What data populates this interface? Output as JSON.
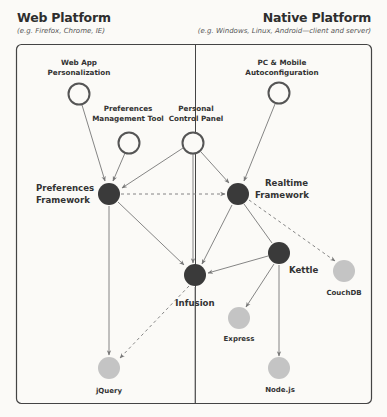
{
  "platforms": {
    "web": {
      "title": "Web Platform",
      "subtitle": "(e.g. Firefox, Chrome, IE)"
    },
    "native": {
      "title": "Native Platform",
      "subtitle": "(e.g. Windows, Linux, Android—client and server)"
    }
  },
  "nodes": {
    "web_app_personalization": {
      "label_line1": "Web App",
      "label_line2": "Personalization",
      "kind": "open"
    },
    "preferences_management_tool": {
      "label_line1": "Preferences",
      "label_line2": "Management Tool",
      "kind": "open"
    },
    "personal_control_panel": {
      "label_line1": "Personal",
      "label_line2": "Control Panel",
      "kind": "open"
    },
    "pc_mobile_autoconfiguration": {
      "label_line1": "PC & Mobile",
      "label_line2": "Autoconfiguration",
      "kind": "open"
    },
    "preferences_framework": {
      "label_line1": "Preferences",
      "label_line2": "Framework",
      "kind": "dark"
    },
    "realtime_framework": {
      "label_line1": "Realtime",
      "label_line2": "Framework",
      "kind": "dark"
    },
    "infusion": {
      "label": "Infusion",
      "kind": "dark"
    },
    "kettle": {
      "label": "Kettle",
      "kind": "dark"
    },
    "couchdb": {
      "label": "CouchDB",
      "kind": "external"
    },
    "express": {
      "label": "Express",
      "kind": "external"
    },
    "jquery": {
      "label": "jQuery",
      "kind": "external"
    },
    "nodejs": {
      "label": "Node.js",
      "kind": "external"
    }
  },
  "edges": [
    {
      "from": "Web App Personalization",
      "to": "Preferences Framework",
      "style": "solid"
    },
    {
      "from": "Preferences Management Tool",
      "to": "Preferences Framework",
      "style": "solid"
    },
    {
      "from": "Personal Control Panel",
      "to": "Preferences Framework",
      "style": "solid"
    },
    {
      "from": "Personal Control Panel",
      "to": "Realtime Framework",
      "style": "solid"
    },
    {
      "from": "Personal Control Panel",
      "to": "Infusion",
      "style": "solid"
    },
    {
      "from": "PC & Mobile Autoconfiguration",
      "to": "Realtime Framework",
      "style": "solid"
    },
    {
      "from": "Preferences Framework",
      "to": "Realtime Framework",
      "style": "dashed"
    },
    {
      "from": "Preferences Framework",
      "to": "Infusion",
      "style": "solid"
    },
    {
      "from": "Preferences Framework",
      "to": "jQuery",
      "style": "solid"
    },
    {
      "from": "Realtime Framework",
      "to": "Infusion",
      "style": "solid"
    },
    {
      "from": "Realtime Framework",
      "to": "Kettle",
      "style": "solid"
    },
    {
      "from": "Realtime Framework",
      "to": "CouchDB",
      "style": "dashed"
    },
    {
      "from": "Kettle",
      "to": "Infusion",
      "style": "solid"
    },
    {
      "from": "Kettle",
      "to": "Express",
      "style": "solid"
    },
    {
      "from": "Kettle",
      "to": "Node.js",
      "style": "solid"
    },
    {
      "from": "Infusion",
      "to": "jQuery",
      "style": "dashed"
    }
  ],
  "colors": {
    "dark_node": "#3a3a3a",
    "open_node_stroke": "#555555",
    "external_node": "#c4c4c4",
    "edge": "#777777",
    "frame": "#444444"
  }
}
